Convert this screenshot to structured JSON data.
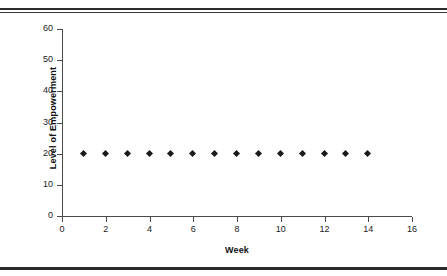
{
  "chart_data": {
    "type": "scatter",
    "title": "",
    "xlabel": "Week",
    "ylabel": "Level of Empowerment",
    "x": [
      1,
      2,
      3,
      4,
      5,
      6,
      7,
      8,
      9,
      10,
      11,
      12,
      13,
      14
    ],
    "values": [
      20,
      20,
      20,
      20,
      20,
      20,
      20,
      20,
      20,
      20,
      20,
      20,
      20,
      20
    ],
    "series": [
      {
        "name": "Level of Empowerment",
        "values": [
          20,
          20,
          20,
          20,
          20,
          20,
          20,
          20,
          20,
          20,
          20,
          20,
          20,
          20
        ]
      }
    ],
    "xlim": [
      0,
      16
    ],
    "ylim": [
      0,
      60
    ],
    "xticks": [
      0,
      2,
      4,
      6,
      8,
      10,
      12,
      14,
      16
    ],
    "yticks": [
      0,
      10,
      20,
      30,
      40,
      50,
      60
    ],
    "xtick_labels": [
      "0",
      "2",
      "4",
      "6",
      "8",
      "10",
      "12",
      "14",
      "16"
    ],
    "ytick_labels": [
      "0",
      "10",
      "20",
      "30",
      "40",
      "50",
      "60"
    ],
    "grid": false,
    "legend": false,
    "legend_position": "none",
    "marker": "diamond",
    "marker_color": "#1a1a1a",
    "axis_color": "#4a4a4a",
    "background": "#ffffff",
    "rule_color": "#2b2b2b"
  }
}
